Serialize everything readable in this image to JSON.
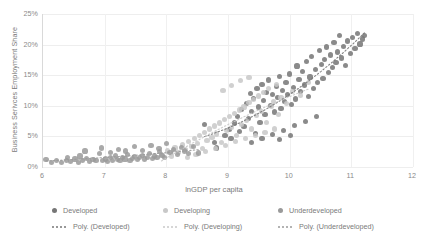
{
  "chart_data": {
    "type": "scatter",
    "title": "",
    "xlabel": "lnGDP per capita",
    "ylabel": "Business Serivces Employment Share",
    "xlim": [
      6,
      12
    ],
    "ylim": [
      0,
      0.25
    ],
    "xticks": [
      "6",
      "7",
      "8",
      "9",
      "10",
      "11",
      "12"
    ],
    "yticks": [
      "0%",
      "5%",
      "10%",
      "15%",
      "20%",
      "25%"
    ],
    "grid": "both",
    "legend_position": "bottom",
    "series": [
      {
        "name": "Developed",
        "color": "#767676",
        "marker": "circle",
        "points": [
          [
            8.62,
            0.069
          ],
          [
            8.78,
            0.04
          ],
          [
            8.81,
            0.031
          ],
          [
            8.95,
            0.052
          ],
          [
            9.02,
            0.061
          ],
          [
            9.05,
            0.047
          ],
          [
            9.1,
            0.072
          ],
          [
            9.16,
            0.083
          ],
          [
            9.18,
            0.058
          ],
          [
            9.22,
            0.094
          ],
          [
            9.26,
            0.066
          ],
          [
            9.3,
            0.104
          ],
          [
            9.33,
            0.079
          ],
          [
            9.36,
            0.12
          ],
          [
            9.38,
            0.091
          ],
          [
            9.41,
            0.112
          ],
          [
            9.44,
            0.055
          ],
          [
            9.47,
            0.128
          ],
          [
            9.5,
            0.098
          ],
          [
            9.52,
            0.073
          ],
          [
            9.55,
            0.135
          ],
          [
            9.58,
            0.108
          ],
          [
            9.6,
            0.086
          ],
          [
            9.63,
            0.122
          ],
          [
            9.66,
            0.142
          ],
          [
            9.69,
            0.101
          ],
          [
            9.72,
            0.118
          ],
          [
            9.75,
            0.09
          ],
          [
            9.78,
            0.131
          ],
          [
            9.8,
            0.113
          ],
          [
            9.83,
            0.148
          ],
          [
            9.86,
            0.096
          ],
          [
            9.88,
            0.125
          ],
          [
            9.91,
            0.107
          ],
          [
            9.94,
            0.138
          ],
          [
            9.97,
            0.119
          ],
          [
            10.0,
            0.152
          ],
          [
            10.03,
            0.102
          ],
          [
            10.06,
            0.13
          ],
          [
            10.09,
            0.111
          ],
          [
            10.12,
            0.165
          ],
          [
            10.15,
            0.143
          ],
          [
            10.18,
            0.124
          ],
          [
            10.21,
            0.156
          ],
          [
            10.24,
            0.134
          ],
          [
            10.27,
            0.172
          ],
          [
            10.3,
            0.115
          ],
          [
            10.33,
            0.147
          ],
          [
            10.36,
            0.18
          ],
          [
            10.39,
            0.128
          ],
          [
            10.42,
            0.159
          ],
          [
            10.45,
            0.138
          ],
          [
            10.48,
            0.19
          ],
          [
            10.51,
            0.167
          ],
          [
            10.54,
            0.145
          ],
          [
            10.57,
            0.176
          ],
          [
            10.6,
            0.196
          ],
          [
            10.63,
            0.154
          ],
          [
            10.66,
            0.183
          ],
          [
            10.69,
            0.162
          ],
          [
            10.72,
            0.204
          ],
          [
            10.75,
            0.171
          ],
          [
            10.78,
            0.188
          ],
          [
            10.81,
            0.215
          ],
          [
            10.84,
            0.178
          ],
          [
            10.87,
            0.197
          ],
          [
            10.9,
            0.166
          ],
          [
            10.94,
            0.206
          ],
          [
            10.98,
            0.185
          ],
          [
            11.02,
            0.212
          ],
          [
            11.06,
            0.193
          ],
          [
            11.1,
            0.218
          ],
          [
            11.14,
            0.201
          ],
          [
            11.18,
            0.209
          ],
          [
            11.22,
            0.215
          ],
          [
            9.38,
            0.04
          ],
          [
            9.55,
            0.046
          ],
          [
            9.72,
            0.053
          ],
          [
            9.9,
            0.06
          ],
          [
            10.08,
            0.068
          ],
          [
            10.26,
            0.075
          ],
          [
            10.44,
            0.082
          ],
          [
            9.84,
            0.045
          ],
          [
            10.02,
            0.052
          ]
        ]
      },
      {
        "name": "Developing",
        "color": "#c8c8c8",
        "marker": "circle",
        "points": [
          [
            7.92,
            0.021
          ],
          [
            8.02,
            0.026
          ],
          [
            8.08,
            0.018
          ],
          [
            8.14,
            0.031
          ],
          [
            8.2,
            0.024
          ],
          [
            8.26,
            0.036
          ],
          [
            8.31,
            0.028
          ],
          [
            8.36,
            0.042
          ],
          [
            8.41,
            0.033
          ],
          [
            8.46,
            0.047
          ],
          [
            8.5,
            0.038
          ],
          [
            8.54,
            0.052
          ],
          [
            8.58,
            0.03
          ],
          [
            8.62,
            0.057
          ],
          [
            8.66,
            0.043
          ],
          [
            8.7,
            0.062
          ],
          [
            8.74,
            0.048
          ],
          [
            8.78,
            0.067
          ],
          [
            8.82,
            0.054
          ],
          [
            8.86,
            0.072
          ],
          [
            8.9,
            0.04
          ],
          [
            8.94,
            0.077
          ],
          [
            8.98,
            0.059
          ],
          [
            9.02,
            0.082
          ],
          [
            9.06,
            0.065
          ],
          [
            9.1,
            0.088
          ],
          [
            9.14,
            0.051
          ],
          [
            9.18,
            0.093
          ],
          [
            9.22,
            0.07
          ],
          [
            9.26,
            0.098
          ],
          [
            9.3,
            0.076
          ],
          [
            9.34,
            0.105
          ],
          [
            9.38,
            0.062
          ],
          [
            9.42,
            0.11
          ],
          [
            9.46,
            0.084
          ],
          [
            9.5,
            0.116
          ],
          [
            9.54,
            0.091
          ],
          [
            9.58,
            0.122
          ],
          [
            9.62,
            0.073
          ],
          [
            9.66,
            0.128
          ],
          [
            9.7,
            0.099
          ],
          [
            9.74,
            0.107
          ],
          [
            9.78,
            0.135
          ],
          [
            9.82,
            0.086
          ],
          [
            9.86,
            0.114
          ],
          [
            8.34,
            0.015
          ],
          [
            8.48,
            0.02
          ],
          [
            8.64,
            0.025
          ],
          [
            8.8,
            0.03
          ],
          [
            8.96,
            0.035
          ],
          [
            9.12,
            0.041
          ],
          [
            9.28,
            0.046
          ],
          [
            9.44,
            0.051
          ],
          [
            9.6,
            0.057
          ],
          [
            9.76,
            0.062
          ],
          [
            9.2,
            0.141
          ],
          [
            9.34,
            0.146
          ],
          [
            9.06,
            0.133
          ],
          [
            8.92,
            0.125
          ],
          [
            10.05,
            0.123
          ],
          [
            10.18,
            0.117
          ],
          [
            9.95,
            0.104
          ],
          [
            10.3,
            0.138
          ]
        ]
      },
      {
        "name": "Underdeveloped",
        "color": "#9a9a9a",
        "marker": "circle",
        "points": [
          [
            6.05,
            0.012
          ],
          [
            6.14,
            0.008
          ],
          [
            6.22,
            0.01
          ],
          [
            6.3,
            0.007
          ],
          [
            6.38,
            0.011
          ],
          [
            6.45,
            0.009
          ],
          [
            6.52,
            0.013
          ],
          [
            6.58,
            0.008
          ],
          [
            6.64,
            0.01
          ],
          [
            6.7,
            0.014
          ],
          [
            6.76,
            0.009
          ],
          [
            6.81,
            0.012
          ],
          [
            6.86,
            0.01
          ],
          [
            6.91,
            0.022
          ],
          [
            6.96,
            0.011
          ],
          [
            7.01,
            0.013
          ],
          [
            7.05,
            0.009
          ],
          [
            7.09,
            0.015
          ],
          [
            7.13,
            0.011
          ],
          [
            7.17,
            0.018
          ],
          [
            7.21,
            0.012
          ],
          [
            7.25,
            0.01
          ],
          [
            7.29,
            0.016
          ],
          [
            7.33,
            0.013
          ],
          [
            7.37,
            0.02
          ],
          [
            7.41,
            0.011
          ],
          [
            7.45,
            0.014
          ],
          [
            7.49,
            0.017
          ],
          [
            7.53,
            0.012
          ],
          [
            7.57,
            0.015
          ],
          [
            7.61,
            0.019
          ],
          [
            7.65,
            0.013
          ],
          [
            7.69,
            0.016
          ],
          [
            7.73,
            0.022
          ],
          [
            7.77,
            0.014
          ],
          [
            7.81,
            0.018
          ],
          [
            7.85,
            0.016
          ],
          [
            7.89,
            0.025
          ],
          [
            7.93,
            0.019
          ],
          [
            7.97,
            0.015
          ],
          [
            6.68,
            0.026
          ],
          [
            6.95,
            0.031
          ],
          [
            7.22,
            0.029
          ],
          [
            7.48,
            0.033
          ],
          [
            7.62,
            0.027
          ],
          [
            7.75,
            0.035
          ],
          [
            7.88,
            0.03
          ],
          [
            8.0,
            0.038
          ],
          [
            8.06,
            0.024
          ],
          [
            8.12,
            0.028
          ],
          [
            8.18,
            0.02
          ],
          [
            8.24,
            0.032
          ],
          [
            8.3,
            0.026
          ],
          [
            8.36,
            0.022
          ],
          [
            8.44,
            0.034
          ],
          [
            7.1,
            0.024
          ],
          [
            7.34,
            0.026
          ],
          [
            6.4,
            0.016
          ],
          [
            6.6,
            0.018
          ],
          [
            8.52,
            0.023
          ]
        ]
      }
    ],
    "trendlines": [
      {
        "name": "Poly. (Developed)",
        "color": "#767676",
        "style": "dotted"
      },
      {
        "name": "Poly. (Developing)",
        "color": "#c8c8c8",
        "style": "dotted"
      },
      {
        "name": "Poly. (Underdeveloped)",
        "color": "#9a9a9a",
        "style": "dotted"
      }
    ]
  },
  "legend": {
    "row1": [
      {
        "label": "Developed",
        "color": "#767676"
      },
      {
        "label": "Developing",
        "color": "#c8c8c8"
      },
      {
        "label": "Underdeveloped",
        "color": "#9a9a9a"
      }
    ],
    "row2": [
      {
        "label": "Poly. (Developed)",
        "color": "#767676"
      },
      {
        "label": "Poly. (Developing)",
        "color": "#c8c8c8"
      },
      {
        "label": "Poly. (Underdeveloped)",
        "color": "#9a9a9a"
      }
    ]
  }
}
